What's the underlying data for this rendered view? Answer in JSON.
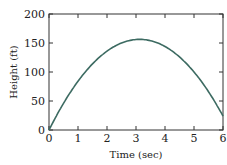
{
  "chart_data": {
    "type": "line",
    "title": "",
    "xlabel": "Time (sec)",
    "ylabel": "Height (ft)",
    "xlim": [
      0,
      6
    ],
    "ylim": [
      0,
      200
    ],
    "xticks": [
      "0",
      "1",
      "2",
      "3",
      "4",
      "5",
      "6"
    ],
    "yticks": [
      "0",
      "50",
      "100",
      "150",
      "200"
    ],
    "grid": false,
    "series": [
      {
        "name": "height",
        "color": "#3d6b62",
        "x": [
          0,
          0.5,
          1,
          1.5,
          2,
          2.5,
          3,
          3.125,
          3.5,
          4,
          4.5,
          5,
          5.5,
          6
        ],
        "y": [
          0,
          46,
          84,
          114,
          136,
          150,
          156,
          156.25,
          154,
          144,
          126,
          100,
          66,
          24
        ]
      }
    ]
  }
}
